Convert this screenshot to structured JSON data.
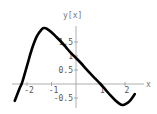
{
  "chart_data": {
    "type": "line",
    "title": "",
    "xlabel": "x",
    "ylabel": "y[x]",
    "xlim": [
      -2.5,
      2.4
    ],
    "ylim": [
      -0.8,
      2.0
    ],
    "grid": false,
    "legend": null,
    "x_ticks": [
      -2,
      -1,
      1,
      2
    ],
    "x_tick_labels": [
      "-2",
      "-1",
      "1",
      "2"
    ],
    "y_ticks": [
      -0.5,
      0.5,
      1,
      1.5
    ],
    "y_tick_labels": [
      "-0.5",
      "0.5",
      "1",
      "1.5"
    ],
    "series": [
      {
        "name": "y[x]",
        "color": "#000000",
        "x": [
          -2.5,
          -2.3,
          -2.2,
          -2.0,
          -1.8,
          -1.6,
          -1.4,
          -1.3,
          -1.2,
          -1.0,
          -0.8,
          -0.6,
          -0.4,
          -0.2,
          0.0,
          0.2,
          0.4,
          0.6,
          0.8,
          1.0,
          1.2,
          1.4,
          1.6,
          1.8,
          1.9,
          2.0,
          2.2,
          2.4
        ],
        "y": [
          -0.6,
          -0.15,
          0.05,
          0.65,
          1.25,
          1.7,
          1.95,
          2.0,
          1.98,
          1.85,
          1.68,
          1.5,
          1.3,
          1.1,
          0.93,
          0.75,
          0.55,
          0.36,
          0.18,
          0.0,
          -0.2,
          -0.4,
          -0.58,
          -0.72,
          -0.75,
          -0.73,
          -0.6,
          -0.36
        ]
      }
    ]
  }
}
